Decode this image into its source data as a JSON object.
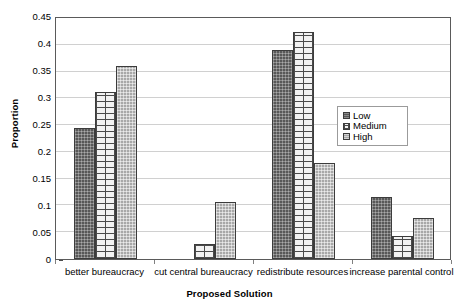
{
  "chart_data": {
    "type": "bar",
    "title": "",
    "xlabel": "Proposed Solution",
    "ylabel": "Proportion",
    "categories": [
      "better bureaucracy",
      "cut central bureaucracy",
      "redistribute resources",
      "increase parental control"
    ],
    "series": [
      {
        "name": "Low",
        "values": [
          0.245,
          0.0,
          0.39,
          0.115
        ]
      },
      {
        "name": "Medium",
        "values": [
          0.312,
          0.028,
          0.424,
          0.043
        ]
      },
      {
        "name": "High",
        "values": [
          0.36,
          0.107,
          0.18,
          0.077
        ]
      }
    ],
    "ylim": [
      0,
      0.45
    ],
    "ytick_step": 0.05,
    "ytick_labels": [
      "0",
      "0.05",
      "0.1",
      "0.15",
      "0.2",
      "0.25",
      "0.3",
      "0.35",
      "0.4",
      "0.45"
    ],
    "grid": true,
    "grid_axis": "y",
    "legend_position": "center-right",
    "legend_entries": [
      "Low",
      "Medium",
      "High"
    ],
    "colors": {
      "low": "#585858",
      "medium": "#f2f2f2",
      "high": "#a8a8a8",
      "bar_border": "#3c3c3c",
      "gridline": "#d0d0d0",
      "plot_border": "#5a5a5a",
      "text": "#000000",
      "background": "#ffffff"
    },
    "patterns": {
      "low": "dark-crosshatch",
      "medium": "brick",
      "high": "gray-stipple"
    }
  }
}
